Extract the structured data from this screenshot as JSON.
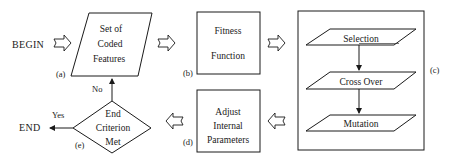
{
  "diagram": {
    "type": "flowchart",
    "terminals": {
      "begin": "BEGIN",
      "end": "END"
    },
    "nodes": {
      "a": {
        "tag": "(a)",
        "shape": "parallelogram",
        "lines": [
          "Set of",
          "Coded",
          "Features"
        ]
      },
      "b": {
        "tag": "(b)",
        "shape": "rectangle",
        "lines": [
          "Fitness",
          "Function"
        ]
      },
      "c": {
        "tag": "(c)",
        "shape": "rectangle-container",
        "steps": [
          "Selection",
          "Cross Over",
          "Mutation"
        ]
      },
      "d": {
        "tag": "(d)",
        "shape": "rectangle",
        "lines": [
          "Adjust",
          "Internal",
          "Parameters"
        ]
      },
      "e": {
        "tag": "(e)",
        "shape": "diamond",
        "lines": [
          "End",
          "Criterion",
          "Met"
        ]
      }
    },
    "edge_labels": {
      "yes": "Yes",
      "no": "No"
    },
    "colors": {
      "stroke": "#1a1a1a",
      "background": "#ffffff"
    }
  }
}
